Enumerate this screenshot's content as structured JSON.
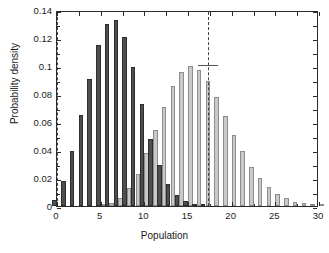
{
  "chart_data": {
    "type": "bar",
    "title": "",
    "subtitle": "",
    "xlabel": "Population",
    "ylabel": "Probability density",
    "xlim": [
      0,
      30
    ],
    "ylim": [
      0,
      0.14
    ],
    "xticks": [
      0,
      5,
      10,
      15,
      20,
      25,
      30
    ],
    "xticklabels": [
      "0",
      "5",
      "10",
      "15",
      "20",
      "25",
      "30"
    ],
    "yticks": [
      0,
      0.02,
      0.04,
      0.06,
      0.08,
      0.1,
      0.12,
      0.14
    ],
    "yticklabels": [
      "0",
      "0.02",
      "0.04",
      "0.06",
      "0.08",
      "0.1",
      "0.12",
      "0.14"
    ],
    "grid": false,
    "legend": false,
    "legend_position": "none",
    "x": [
      0,
      1,
      2,
      3,
      4,
      5,
      6,
      7,
      8,
      9,
      10,
      11,
      12,
      13,
      14,
      15,
      16,
      17,
      18,
      19,
      20,
      21,
      22,
      23,
      24,
      25,
      26,
      27,
      28,
      29,
      30
    ],
    "series": [
      {
        "name": "dark-distribution",
        "color": "#4e4e4e",
        "edge_color": "#2e2e2e",
        "values": [
          0.004,
          0.018,
          0.039,
          0.065,
          0.091,
          0.115,
          0.13,
          0.133,
          0.121,
          0.099,
          0.073,
          0.048,
          0.029,
          0.016,
          0.008,
          0.0035,
          0.0012,
          0.0005,
          0,
          0,
          0,
          0,
          0,
          0,
          0,
          0,
          0,
          0,
          0,
          0,
          0
        ]
      },
      {
        "name": "light-distribution",
        "color": "#c9c9c9",
        "edge_color": "#8d8d8d",
        "values": [
          0,
          0,
          0,
          0,
          0,
          0.0008,
          0.0022,
          0.0055,
          0.013,
          0.023,
          0.038,
          0.054,
          0.071,
          0.086,
          0.096,
          0.1,
          0.097,
          0.089,
          0.078,
          0.064,
          0.051,
          0.039,
          0.028,
          0.02,
          0.0135,
          0.0088,
          0.0055,
          0.0032,
          0.0018,
          0.001,
          0.0005
        ]
      }
    ],
    "annotations": [
      {
        "name": "dashed-line-left",
        "type": "vline",
        "x": 0.0,
        "style": "dashed",
        "color": "#444444"
      },
      {
        "name": "dashed-line-right",
        "type": "vline",
        "x": 17.3,
        "style": "dashed",
        "color": "#444444"
      },
      {
        "name": "mean-marker",
        "type": "hmark",
        "x": 17.3,
        "y": 0.1,
        "half_width": 1.1,
        "color": "#555555"
      }
    ]
  },
  "axes": {
    "x_title": "Population",
    "y_title": "Probability density"
  }
}
